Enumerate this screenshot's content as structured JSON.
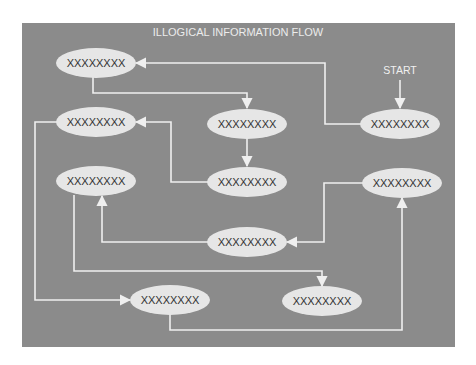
{
  "title": "ILLOGICAL INFORMATION FLOW",
  "start_label": "START",
  "colors": {
    "background": "#ffffff",
    "panel": "#8b8b8b",
    "node_fill": "#e6e6e6",
    "node_text": "#333333",
    "line": "#efefef",
    "title_text": "#ececec"
  },
  "nodes": [
    {
      "id": "n1",
      "label": "XXXXXXXX",
      "cx": 96,
      "cy": 63
    },
    {
      "id": "n2",
      "label": "XXXXXXXX",
      "cx": 247,
      "cy": 124
    },
    {
      "id": "n3",
      "label": "XXXXXXXX",
      "cx": 400,
      "cy": 124,
      "is_start": true
    },
    {
      "id": "n4",
      "label": "XXXXXXXX",
      "cx": 96,
      "cy": 122
    },
    {
      "id": "n5",
      "label": "XXXXXXXX",
      "cx": 247,
      "cy": 182
    },
    {
      "id": "n6",
      "label": "XXXXXXXX",
      "cx": 96,
      "cy": 181
    },
    {
      "id": "n7",
      "label": "XXXXXXXX",
      "cx": 402,
      "cy": 183
    },
    {
      "id": "n8",
      "label": "XXXXXXXX",
      "cx": 247,
      "cy": 242
    },
    {
      "id": "n9",
      "label": "XXXXXXXX",
      "cx": 322,
      "cy": 301
    },
    {
      "id": "n10",
      "label": "XXXXXXXX",
      "cx": 170,
      "cy": 300
    }
  ],
  "edges": [
    {
      "from": "start",
      "to": "n3"
    },
    {
      "from": "n3",
      "to": "n1"
    },
    {
      "from": "n1",
      "to": "n2"
    },
    {
      "from": "n2",
      "to": "n5"
    },
    {
      "from": "n5",
      "to": "n4"
    },
    {
      "from": "n4",
      "to": "n10"
    },
    {
      "from": "n10",
      "to": "n7"
    },
    {
      "from": "n7",
      "to": "n8"
    },
    {
      "from": "n8",
      "to": "n6"
    },
    {
      "from": "n6",
      "to": "n9"
    }
  ]
}
